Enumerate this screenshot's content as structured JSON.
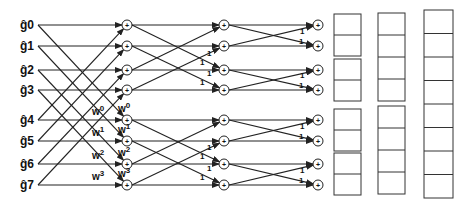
{
  "diagram": {
    "type": "FFT butterfly (decimation, 8-point)",
    "inputs": [
      "ĝ0",
      "ĝ1",
      "ĝ2",
      "ĝ3",
      "ĝ4",
      "ĝ5",
      "ĝ6",
      "ĝ7"
    ],
    "stage1_twiddles": [
      "W0",
      "W1",
      "W2",
      "W3"
    ],
    "twiddle_bases": [
      "w",
      "w",
      "w",
      "w"
    ],
    "twiddle_exps": [
      "0",
      "1",
      "2",
      "3"
    ],
    "stage_gain_label": "1",
    "output_column_1": [
      {
        "name": "g",
        "sub": "0",
        "bits": "000"
      },
      {
        "name": "g",
        "sub": "4",
        "bits": "100"
      },
      {
        "name": "g",
        "sub": "2",
        "bits": "010"
      },
      {
        "name": "g",
        "sub": "6",
        "bits": "110"
      },
      {
        "name": "g",
        "sub": "1",
        "bits": "001"
      },
      {
        "name": "g",
        "sub": "5",
        "bits": "101"
      },
      {
        "name": "g",
        "sub": "3",
        "bits": "011"
      },
      {
        "name": "g",
        "sub": "7",
        "bits": "111"
      }
    ],
    "output_column_2": [
      {
        "name": "g",
        "sub": "0"
      },
      {
        "name": "g",
        "sub": "2"
      },
      {
        "name": "g",
        "sub": "4"
      },
      {
        "name": "g",
        "sub": "6"
      },
      {
        "name": "g",
        "sub": "1"
      },
      {
        "name": "g",
        "sub": "3"
      },
      {
        "name": "g",
        "sub": "5"
      },
      {
        "name": "g",
        "sub": "7"
      }
    ],
    "output_column_3": [
      {
        "name": "g",
        "sub": "0",
        "bits": "000"
      },
      {
        "name": "g",
        "sub": "1",
        "bits": "001"
      },
      {
        "name": "g",
        "sub": "2",
        "bits": "010"
      },
      {
        "name": "g",
        "sub": "3",
        "bits": "011"
      },
      {
        "name": "g",
        "sub": "4",
        "bits": "100"
      },
      {
        "name": "g",
        "sub": "5",
        "bits": "101"
      },
      {
        "name": "g",
        "sub": "6",
        "bits": "110"
      },
      {
        "name": "g",
        "sub": "7",
        "bits": "111"
      }
    ]
  }
}
